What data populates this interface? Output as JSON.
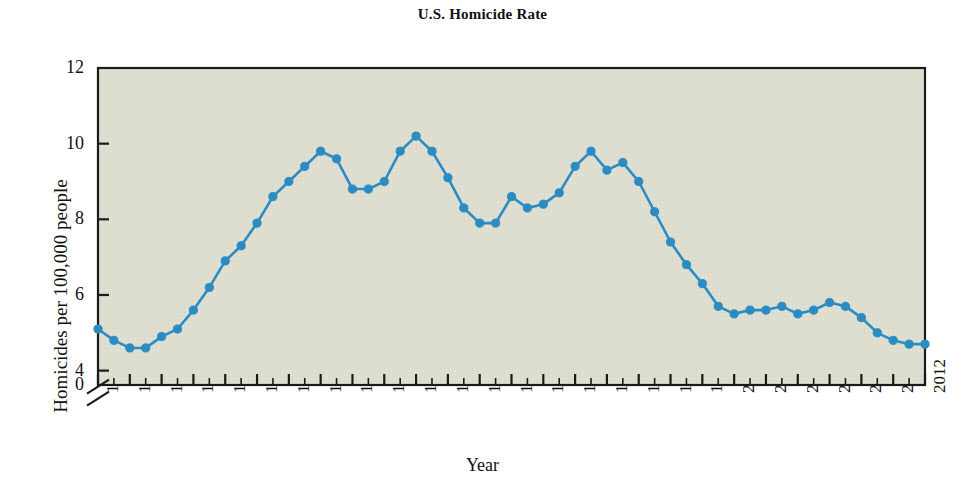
{
  "chart_data": {
    "type": "line",
    "title": "U.S. Homicide Rate",
    "xlabel": "Year",
    "ylabel": "Homicides per 100,000 people",
    "grid": false,
    "legend": null,
    "axis_break": true,
    "axis_break_note": "y-axis broken between 0 and 4",
    "xlim": [
      1960,
      2012
    ],
    "ylim": [
      4,
      12
    ],
    "ytick_labels": [
      "0",
      "4",
      "6",
      "8",
      "10",
      "12"
    ],
    "ytick_values": [
      0,
      4,
      6,
      8,
      10,
      12
    ],
    "xtick_labels": [
      "1960",
      "1962",
      "1964",
      "1966",
      "1968",
      "1970",
      "1972",
      "1974",
      "1976",
      "1978",
      "1980",
      "1982",
      "1984",
      "1986",
      "1988",
      "1990",
      "1992",
      "1994",
      "1996",
      "1998",
      "2000",
      "2002",
      "2004",
      "2006",
      "2008",
      "2010",
      "2012"
    ],
    "xtick_values": [
      1960,
      1962,
      1964,
      1966,
      1968,
      1970,
      1972,
      1974,
      1976,
      1978,
      1980,
      1982,
      1984,
      1986,
      1988,
      1990,
      1992,
      1994,
      1996,
      1998,
      2000,
      2002,
      2004,
      2006,
      2008,
      2010,
      2012
    ],
    "minor_xticks_every": 1,
    "series": [
      {
        "name": "U.S. Homicide Rate",
        "color": "#2b8cc4",
        "marker": "circle",
        "x": [
          1960,
          1961,
          1962,
          1963,
          1964,
          1965,
          1966,
          1967,
          1968,
          1969,
          1970,
          1971,
          1972,
          1973,
          1974,
          1975,
          1976,
          1977,
          1978,
          1979,
          1980,
          1981,
          1982,
          1983,
          1984,
          1985,
          1986,
          1987,
          1988,
          1989,
          1990,
          1991,
          1992,
          1993,
          1994,
          1995,
          1996,
          1997,
          1998,
          1999,
          2000,
          2001,
          2002,
          2003,
          2004,
          2005,
          2006,
          2007,
          2008,
          2009,
          2010,
          2011,
          2012
        ],
        "values": [
          5.1,
          4.8,
          4.6,
          4.6,
          4.9,
          5.1,
          5.6,
          6.2,
          6.9,
          7.3,
          7.9,
          8.6,
          9.0,
          9.4,
          9.8,
          9.6,
          8.8,
          8.8,
          9.0,
          9.8,
          10.2,
          9.8,
          9.1,
          8.3,
          7.9,
          7.9,
          8.6,
          8.3,
          8.4,
          8.7,
          9.4,
          9.8,
          9.3,
          9.5,
          9.0,
          8.2,
          7.4,
          6.8,
          6.3,
          5.7,
          5.5,
          5.6,
          5.6,
          5.7,
          5.5,
          5.6,
          5.8,
          5.7,
          5.4,
          5.0,
          4.8,
          4.7,
          4.7
        ]
      }
    ]
  },
  "figure": {
    "plot_bg_color": "#dfdfd2",
    "frame_color": "#1a1a1a",
    "page_bg_color": "#ffffff"
  }
}
